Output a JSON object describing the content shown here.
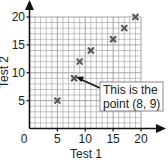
{
  "chart_data": {
    "type": "scatter",
    "title": "",
    "xlabel": "Test 1",
    "ylabel": "Test 2",
    "xlim": [
      0,
      20
    ],
    "ylim": [
      0,
      20
    ],
    "xticks": [
      0,
      5,
      10,
      15,
      20
    ],
    "yticks": [
      5,
      10,
      15,
      20
    ],
    "grid": true,
    "grid_step": 1,
    "marker": "x",
    "series": [
      {
        "name": "Scores",
        "points": [
          {
            "x": 5,
            "y": 5
          },
          {
            "x": 8,
            "y": 9
          },
          {
            "x": 9,
            "y": 12
          },
          {
            "x": 11,
            "y": 14
          },
          {
            "x": 15,
            "y": 16
          },
          {
            "x": 17,
            "y": 18
          },
          {
            "x": 19,
            "y": 20
          }
        ]
      }
    ],
    "annotations": [
      {
        "text_line1": "This is the",
        "text_line2": "point (8, 9)",
        "target": {
          "x": 8,
          "y": 9
        }
      }
    ]
  },
  "labels": {
    "origin": "0",
    "x_ticks": [
      "5",
      "10",
      "15",
      "20"
    ],
    "y_ticks": [
      "5",
      "10",
      "15",
      "20"
    ],
    "xlabel": "Test 1",
    "ylabel": "Test 2",
    "callout_line1": "This is the",
    "callout_line2": "point (8, 9)"
  },
  "colors": {
    "axis": "#111111",
    "grid": "#9a9a9a",
    "marker": "#555555",
    "callout_border": "#888888"
  }
}
